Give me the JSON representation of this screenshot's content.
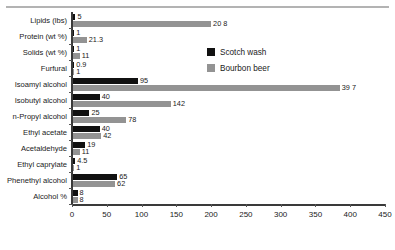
{
  "chart_data": {
    "type": "bar",
    "orientation": "horizontal",
    "title": "",
    "xlabel": "",
    "ylabel": "",
    "categories": [
      "Lipids (lbs)",
      "Protein (wt %)",
      "Solids (wt %)",
      "Furfural",
      "Isoamyl alcohol",
      "Isobutyl alcohol",
      "n-Propyl alcohol",
      "Ethyl acetate",
      "Acetaldehyde",
      "Ethyl caprylate",
      "Phenethyl alcohol",
      "Alcohol %"
    ],
    "series": [
      {
        "name": "Scotch wash",
        "color": "#111111",
        "values": [
          5,
          1,
          1,
          0.9,
          95,
          40,
          25,
          40,
          19,
          4.5,
          65,
          8
        ],
        "labels": [
          "5",
          "1",
          "1",
          "0.9",
          "95",
          "40",
          "25",
          "40",
          "19",
          "4.5",
          "65",
          "8"
        ]
      },
      {
        "name": "Bourbon beer",
        "color": "#939393",
        "values": [
          20.8,
          21.3,
          11,
          1,
          39.7,
          142,
          78,
          42,
          11,
          1,
          62,
          8
        ],
        "labels": [
          "20 8",
          "21.3",
          "11",
          "1",
          "39 7",
          "142",
          "78",
          "42",
          "11",
          "1",
          "62",
          "8"
        ]
      }
    ],
    "xlim": [
      0,
      450
    ],
    "xticks": [
      0,
      50,
      100,
      150,
      200,
      250,
      300,
      350,
      400,
      450
    ],
    "xtick_labels": [
      "0",
      "50",
      "100",
      "150",
      "200",
      "250",
      "300",
      "350",
      "400",
      "450"
    ],
    "grid": false,
    "legend_position": "upper-right-inside",
    "note_long_bars": {
      "bourbon_lipids_bar_extent": 200,
      "bourbon_isoamyl_bar_extent": 385
    }
  }
}
